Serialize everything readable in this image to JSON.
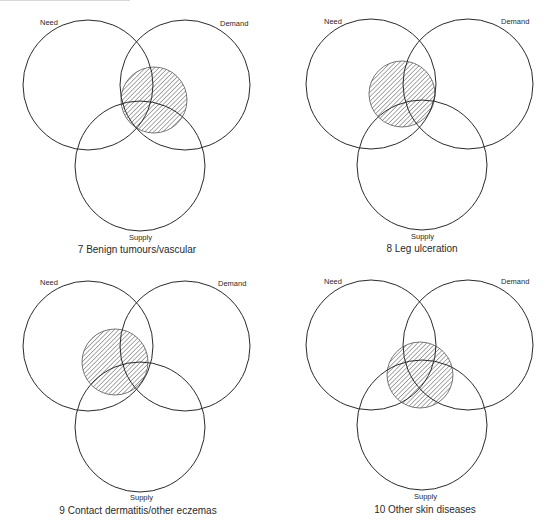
{
  "figure": {
    "hatch_color": "#555555",
    "line_color": "#2a2a2a",
    "panels": [
      {
        "caption": "7 Benign tumours/vascular",
        "caption_pos": [
          137,
          253
        ],
        "labels": {
          "need": {
            "text": "Need",
            "pos": [
              40,
              25
            ]
          },
          "demand": {
            "text": "Demand",
            "pos": [
              220,
              26
            ]
          },
          "supply": {
            "text": "Supply",
            "pos": [
              129,
              240
            ]
          }
        },
        "circles": {
          "need": {
            "cx": 88,
            "cy": 85,
            "r": 65
          },
          "demand": {
            "cx": 185,
            "cy": 85,
            "r": 65
          },
          "supply": {
            "cx": 140,
            "cy": 166,
            "r": 65
          },
          "hatched": {
            "cx": 154,
            "cy": 100,
            "r": 33
          }
        }
      },
      {
        "caption": "8 Leg ulceration",
        "caption_pos": [
          422,
          252
        ],
        "labels": {
          "need": {
            "text": "Need",
            "pos": [
              324,
              24
            ]
          },
          "demand": {
            "text": "Demand",
            "pos": [
              501,
              24
            ]
          },
          "supply": {
            "text": "Supply",
            "pos": [
              411,
              239
            ]
          }
        },
        "circles": {
          "need": {
            "cx": 371,
            "cy": 84,
            "r": 65
          },
          "demand": {
            "cx": 468,
            "cy": 84,
            "r": 65
          },
          "supply": {
            "cx": 422,
            "cy": 165,
            "r": 65
          },
          "hatched": {
            "cx": 402,
            "cy": 94,
            "r": 33
          }
        }
      },
      {
        "caption": "9 Contact dermatitis/other eczemas",
        "caption_pos": [
          138,
          514
        ],
        "labels": {
          "need": {
            "text": "Need",
            "pos": [
              40,
              285
            ]
          },
          "demand": {
            "text": "Demand",
            "pos": [
              218,
              286
            ]
          },
          "supply": {
            "text": "Supply",
            "pos": [
              130,
              500
            ]
          }
        },
        "circles": {
          "need": {
            "cx": 88,
            "cy": 346,
            "r": 65
          },
          "demand": {
            "cx": 185,
            "cy": 346,
            "r": 65
          },
          "supply": {
            "cx": 140,
            "cy": 427,
            "r": 65
          },
          "hatched": {
            "cx": 115,
            "cy": 362,
            "r": 33
          }
        }
      },
      {
        "caption": "10 Other skin diseases",
        "caption_pos": [
          425,
          513
        ],
        "labels": {
          "need": {
            "text": "Need",
            "pos": [
              324,
              284
            ]
          },
          "demand": {
            "text": "Demand",
            "pos": [
              501,
              284
            ]
          },
          "supply": {
            "text": "Supply",
            "pos": [
              414,
              499
            ]
          }
        },
        "circles": {
          "need": {
            "cx": 371,
            "cy": 345,
            "r": 65
          },
          "demand": {
            "cx": 468,
            "cy": 345,
            "r": 65
          },
          "supply": {
            "cx": 422,
            "cy": 425,
            "r": 65
          },
          "hatched": {
            "cx": 420,
            "cy": 375,
            "r": 33
          }
        }
      }
    ]
  }
}
